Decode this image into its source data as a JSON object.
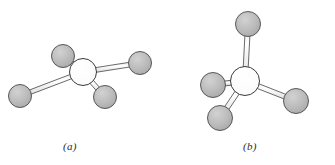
{
  "figure": {
    "background_color": "#ffffff",
    "atom_fill_color": "#b5b5b5",
    "atom_outline_color": "#4a4a4a",
    "center_atom_fill_color": "#ffffff",
    "bond_fill_color": "#f2f2f2",
    "bond_outline_color": "#3a3a3a",
    "panels": [
      {
        "id": "panel-a",
        "label": "(a)",
        "label_x": 63,
        "label_y": 140,
        "center_atom": {
          "name": "central-atom-a",
          "cx": 83,
          "cy": 72,
          "r": 13.5,
          "fill": "#ffffff"
        },
        "ligand_atoms": [
          {
            "name": "ligand-atom-a-upper-left",
            "cx": 63,
            "cy": 56,
            "r": 11.5
          },
          {
            "name": "ligand-atom-a-right",
            "cx": 140,
            "cy": 63,
            "r": 11.5
          },
          {
            "name": "ligand-atom-a-lower-left",
            "cx": 20,
            "cy": 96,
            "r": 11.5
          },
          {
            "name": "ligand-atom-a-lower-mid",
            "cx": 105,
            "cy": 97,
            "r": 11.5
          }
        ],
        "bonds": [
          {
            "name": "bond-a-upper-left",
            "from": [
              83,
              72
            ],
            "to": [
              63,
              56
            ],
            "width": 4.6
          },
          {
            "name": "bond-a-right",
            "from": [
              83,
              72
            ],
            "to": [
              140,
              63
            ],
            "width": 4.6
          },
          {
            "name": "bond-a-lower-left",
            "from": [
              83,
              72
            ],
            "to": [
              20,
              96
            ],
            "width": 4.6
          },
          {
            "name": "bond-a-lower-mid",
            "from": [
              83,
              72
            ],
            "to": [
              105,
              97
            ],
            "width": 4.6
          }
        ]
      },
      {
        "id": "panel-b",
        "label": "(b)",
        "label_x": 243,
        "label_y": 140,
        "center_atom": {
          "name": "central-atom-b",
          "cx": 245,
          "cy": 81,
          "r": 14.5,
          "fill": "#ffffff"
        },
        "ligand_atoms": [
          {
            "name": "ligand-atom-b-top",
            "cx": 248,
            "cy": 24,
            "r": 12.5
          },
          {
            "name": "ligand-atom-b-left",
            "cx": 213,
            "cy": 85,
            "r": 12.5
          },
          {
            "name": "ligand-atom-b-lower-left",
            "cx": 220,
            "cy": 118,
            "r": 12.5
          },
          {
            "name": "ligand-atom-b-right",
            "cx": 296,
            "cy": 101,
            "r": 12.5
          }
        ],
        "bonds": [
          {
            "name": "bond-b-top",
            "from": [
              245,
              81
            ],
            "to": [
              248,
              24
            ],
            "width": 5.0
          },
          {
            "name": "bond-b-left",
            "from": [
              245,
              81
            ],
            "to": [
              213,
              85
            ],
            "width": 5.0
          },
          {
            "name": "bond-b-lower-left",
            "from": [
              245,
              81
            ],
            "to": [
              220,
              118
            ],
            "width": 5.0
          },
          {
            "name": "bond-b-right",
            "from": [
              245,
              81
            ],
            "to": [
              296,
              101
            ],
            "width": 5.0
          }
        ]
      }
    ]
  }
}
